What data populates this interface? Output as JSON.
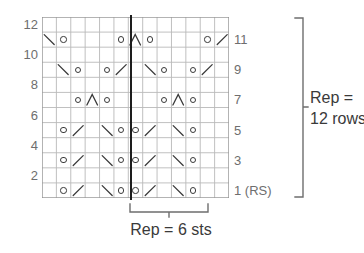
{
  "chart_data": {
    "type": "table",
    "columns": 13,
    "rows": 12,
    "cell_width": 14.38,
    "cell_height": 15.08,
    "repeat_line_column": 6,
    "grid_color": "#b9b9b9",
    "symbol_color": "#3a3a3a",
    "repeat_line_color": "#1d1d1d",
    "label_color": "#6e6e6e",
    "row_labels_left": [
      "12",
      "10",
      "8",
      "6",
      "4",
      "2"
    ],
    "row_labels_right": [
      "11",
      "9",
      "7",
      "5",
      "3",
      "1 (RS)"
    ],
    "legend_symbols": [
      {
        "name": "yo",
        "glyph": "o",
        "meaning": "yarn over"
      },
      {
        "name": "ssk",
        "glyph": "\\",
        "meaning": "left-leaning decrease"
      },
      {
        "name": "k2tog",
        "glyph": "/",
        "meaning": "right-leaning decrease"
      },
      {
        "name": "cdd",
        "glyph": "^",
        "meaning": "centered double decrease"
      }
    ],
    "rows_data": [
      {
        "row": 12,
        "cells": [
          "",
          "",
          "",
          "",
          "",
          "",
          "",
          "",
          "",
          "",
          "",
          "",
          ""
        ]
      },
      {
        "row": 11,
        "cells": [
          "ssk",
          "yo",
          "",
          "",
          "",
          "yo",
          "cdd",
          "yo",
          "",
          "",
          "",
          "yo",
          "k2tog"
        ]
      },
      {
        "row": 10,
        "cells": [
          "",
          "",
          "",
          "",
          "",
          "",
          "",
          "",
          "",
          "",
          "",
          "",
          ""
        ]
      },
      {
        "row": 9,
        "cells": [
          "",
          "ssk",
          "yo",
          "",
          "yo",
          "k2tog",
          "",
          "ssk",
          "yo",
          "",
          "yo",
          "k2tog",
          ""
        ]
      },
      {
        "row": 8,
        "cells": [
          "",
          "",
          "",
          "",
          "",
          "",
          "",
          "",
          "",
          "",
          "",
          "",
          ""
        ]
      },
      {
        "row": 7,
        "cells": [
          "",
          "",
          "yo",
          "cdd",
          "yo",
          "",
          "",
          "",
          "yo",
          "cdd",
          "yo",
          "",
          ""
        ]
      },
      {
        "row": 6,
        "cells": [
          "",
          "",
          "",
          "",
          "",
          "",
          "",
          "",
          "",
          "",
          "",
          "",
          ""
        ]
      },
      {
        "row": 5,
        "cells": [
          "",
          "yo",
          "k2tog",
          "",
          "ssk",
          "yo",
          "yo",
          "k2tog",
          "",
          "ssk",
          "yo",
          "",
          ""
        ]
      },
      {
        "row": 4,
        "cells": [
          "",
          "",
          "",
          "",
          "",
          "",
          "",
          "",
          "",
          "",
          "",
          "",
          ""
        ]
      },
      {
        "row": 3,
        "cells": [
          "",
          "yo",
          "k2tog",
          "",
          "ssk",
          "yo",
          "yo",
          "k2tog",
          "",
          "ssk",
          "yo",
          "",
          ""
        ]
      },
      {
        "row": 2,
        "cells": [
          "",
          "",
          "",
          "",
          "",
          "",
          "",
          "",
          "",
          "",
          "",
          "",
          ""
        ]
      },
      {
        "row": 1,
        "cells": [
          "",
          "yo",
          "k2tog",
          "",
          "ssk",
          "yo",
          "yo",
          "k2tog",
          "",
          "ssk",
          "yo",
          "",
          ""
        ]
      }
    ]
  },
  "annotations": {
    "stitch_repeat_label": "Rep = 6 sts",
    "row_repeat_label_line1": "Rep =",
    "row_repeat_label_line2": "12 rows"
  }
}
